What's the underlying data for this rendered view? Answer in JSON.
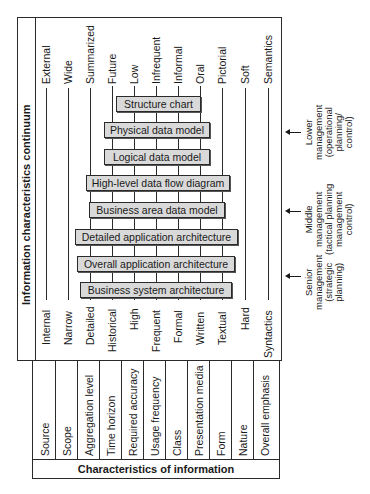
{
  "diagram": {
    "continuum_title": "Information characteristics continuum",
    "characteristics_title": "Characteristics of information",
    "characteristics": [
      {
        "name": "Source",
        "low_end": "Internal",
        "high_end": "External"
      },
      {
        "name": "Scope",
        "low_end": "Narrow",
        "high_end": "Wide"
      },
      {
        "name": "Aggregation level",
        "low_end": "Detailed",
        "high_end": "Summarized"
      },
      {
        "name": "Time horizon",
        "low_end": "Historical",
        "high_end": "Future"
      },
      {
        "name": "Required accuracy",
        "low_end": "High",
        "high_end": "Low"
      },
      {
        "name": "Usage frequency",
        "low_end": "Frequent",
        "high_end": "Infrequent"
      },
      {
        "name": "Class",
        "low_end": "Formal",
        "high_end": "Informal"
      },
      {
        "name": "Presentation media",
        "low_end": "Written",
        "high_end": "Oral"
      },
      {
        "name": "Form",
        "low_end": "Textual",
        "high_end": "Pictorial"
      },
      {
        "name": "Nature",
        "low_end": "Hard",
        "high_end": "Soft"
      },
      {
        "name": "Overall emphasis",
        "low_end": "Syntactics",
        "high_end": "Semantics"
      }
    ],
    "models": [
      {
        "label": "Structure chart"
      },
      {
        "label": "Physical data model"
      },
      {
        "label": "Logical data model"
      },
      {
        "label": "High-level data flow diagram"
      },
      {
        "label": "Business area data model"
      },
      {
        "label": "Detailed application architecture"
      },
      {
        "label": "Overall application architecture"
      },
      {
        "label": "Business system architecture"
      }
    ],
    "management_levels": [
      {
        "lines": [
          "Lower",
          "management",
          "(operational",
          "planning/",
          "control)"
        ]
      },
      {
        "lines": [
          "Middle",
          "management",
          "(tactical planning",
          "management",
          "control)"
        ]
      },
      {
        "lines": [
          "Senior",
          "management",
          "(strategic",
          "planning)"
        ]
      }
    ]
  }
}
